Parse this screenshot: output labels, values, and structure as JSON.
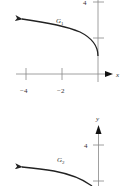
{
  "graph1": {
    "curve_label": "G",
    "curve_sub": "1",
    "y_tick_label": "4",
    "x_axis_label": "x",
    "x_tick_labels": [
      "−4",
      "−2"
    ]
  },
  "graph2": {
    "curve_label": "G",
    "curve_sub": "2",
    "y_tick_label": "4",
    "y_axis_label": "y"
  },
  "colors": {
    "axis": "#777777",
    "curve": "#222222",
    "text": "#333333"
  }
}
